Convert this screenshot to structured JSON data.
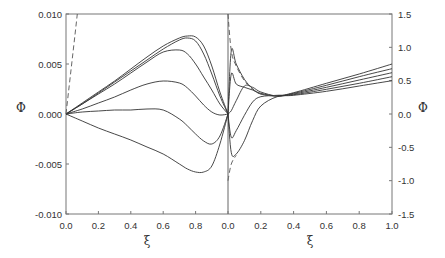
{
  "chart_data": {
    "type": "line",
    "title": "",
    "layout": "two side-by-side panels sharing one frame; left panel uses left y-axis, right panel uses right y-axis",
    "grid": false,
    "legend": null,
    "panels": [
      {
        "name": "left",
        "xlabel": "ξ",
        "ylabel": "Φ",
        "xlim": [
          0.0,
          1.0
        ],
        "ylim": [
          -0.01,
          0.01
        ],
        "xticks": [
          "0.0",
          "0.2",
          "0.4",
          "0.6",
          "0.8"
        ],
        "yticks": [
          "0.010",
          "0.005",
          "0.000",
          "-0.005",
          "-0.010"
        ],
        "x": [
          0.0,
          0.1,
          0.2,
          0.3,
          0.4,
          0.5,
          0.6,
          0.7,
          0.75,
          0.8,
          0.85,
          0.9,
          0.95,
          1.0
        ],
        "series": [
          {
            "name": "curve-1",
            "style": "solid",
            "values": [
              0.0,
              0.0011,
              0.0022,
              0.0033,
              0.0045,
              0.0057,
              0.0068,
              0.0076,
              0.0078,
              0.0077,
              0.0068,
              0.0048,
              0.0022,
              0.0
            ]
          },
          {
            "name": "curve-2",
            "style": "solid",
            "values": [
              0.0,
              0.001,
              0.0021,
              0.0032,
              0.0043,
              0.0054,
              0.0065,
              0.0074,
              0.0076,
              0.0073,
              0.006,
              0.004,
              0.0018,
              0.0
            ]
          },
          {
            "name": "curve-3",
            "style": "solid",
            "values": [
              0.0,
              0.001,
              0.002,
              0.003,
              0.0041,
              0.0052,
              0.0062,
              0.0064,
              0.006,
              0.005,
              0.0037,
              0.0024,
              0.001,
              0.0
            ]
          },
          {
            "name": "curve-4",
            "style": "solid",
            "values": [
              0.0,
              0.0005,
              0.0011,
              0.0017,
              0.0024,
              0.003,
              0.0033,
              0.0031,
              0.0026,
              0.0018,
              0.0009,
              0.0002,
              -0.0001,
              0.0
            ]
          },
          {
            "name": "curve-5",
            "style": "solid",
            "values": [
              0.0,
              0.0002,
              0.0003,
              0.0004,
              0.0004,
              0.0005,
              0.0004,
              -0.0005,
              -0.0012,
              -0.002,
              -0.0027,
              -0.003,
              -0.0022,
              0.0
            ]
          },
          {
            "name": "curve-6",
            "style": "solid",
            "values": [
              0.0,
              -0.0007,
              -0.0014,
              -0.002,
              -0.0026,
              -0.0033,
              -0.004,
              -0.005,
              -0.0055,
              -0.0058,
              -0.0058,
              -0.0052,
              -0.003,
              0.0
            ]
          },
          {
            "name": "dashed-reference",
            "style": "dashed",
            "x": [
              0.0,
              0.07
            ],
            "values": [
              0.0,
              0.01
            ]
          }
        ]
      },
      {
        "name": "right",
        "xlabel": "ξ",
        "ylabel": "Φ",
        "xlim": [
          0.0,
          1.0
        ],
        "ylim": [
          -1.5,
          1.5
        ],
        "xticks": [
          "0.0",
          "0.2",
          "0.4",
          "0.6",
          "0.8",
          "1.0"
        ],
        "yticks": [
          "1.5",
          "1.0",
          "0.5",
          "0.0",
          "-0.5",
          "-1.0",
          "-1.5"
        ],
        "x": [
          0.0,
          0.02,
          0.05,
          0.1,
          0.15,
          0.2,
          0.3,
          0.4,
          0.6,
          0.8,
          1.0
        ],
        "series": [
          {
            "name": "curve-1",
            "style": "solid",
            "values": [
              0.0,
              0.95,
              0.75,
              0.52,
              0.38,
              0.3,
              0.27,
              0.32,
              0.46,
              0.6,
              0.75
            ]
          },
          {
            "name": "curve-2",
            "style": "solid",
            "values": [
              0.0,
              0.6,
              0.45,
              0.4,
              0.36,
              0.31,
              0.27,
              0.31,
              0.43,
              0.56,
              0.68
            ]
          },
          {
            "name": "curve-3",
            "style": "solid",
            "values": [
              0.0,
              0.05,
              0.2,
              0.42,
              0.4,
              0.33,
              0.27,
              0.3,
              0.4,
              0.51,
              0.62
            ]
          },
          {
            "name": "curve-4",
            "style": "solid",
            "values": [
              0.0,
              -0.35,
              -0.25,
              -0.02,
              0.18,
              0.26,
              0.28,
              0.29,
              0.37,
              0.46,
              0.56
            ]
          },
          {
            "name": "curve-5",
            "style": "solid",
            "values": [
              0.0,
              -0.58,
              -0.6,
              -0.4,
              -0.1,
              0.12,
              0.26,
              0.28,
              0.34,
              0.42,
              0.5
            ]
          },
          {
            "name": "dashed-reference",
            "style": "dashed",
            "x": [
              0.0,
              0.02,
              0.05,
              0.1,
              0.15,
              0.2,
              0.3
            ],
            "values": [
              1.5,
              0.95,
              0.72,
              0.5,
              0.37,
              0.3,
              0.27
            ]
          },
          {
            "name": "dashed-lower",
            "style": "dashed",
            "x": [
              0.0,
              0.02,
              0.05
            ],
            "values": [
              -1.0,
              -0.75,
              -0.62
            ]
          }
        ]
      }
    ],
    "xlabel": "ξ",
    "ylabel": "Φ",
    "ylabel_right": "Φ"
  },
  "labels": {
    "x_left": "ξ",
    "x_right": "ξ",
    "y_left": "Φ",
    "y_right": "Φ"
  }
}
